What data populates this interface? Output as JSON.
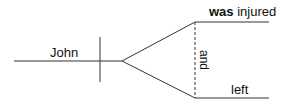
{
  "diagram": {
    "type": "sentence-diagram",
    "subject": "John",
    "predicate_upper": {
      "bold": "was",
      "normal": " injured"
    },
    "predicate_lower": "left",
    "conjunction": "and"
  }
}
